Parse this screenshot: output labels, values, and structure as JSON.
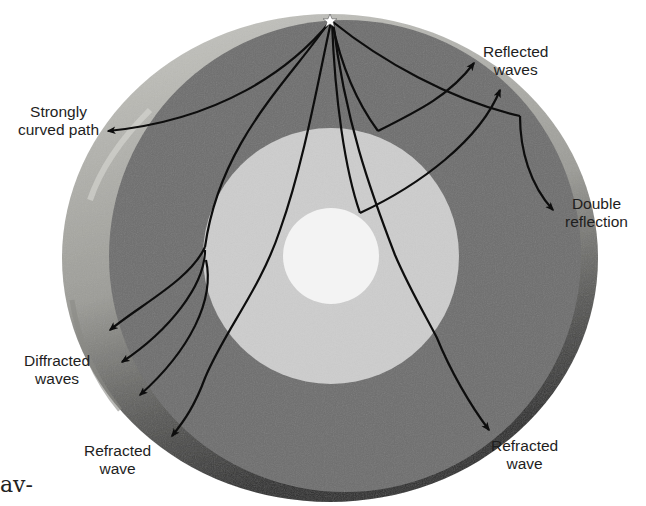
{
  "figure": {
    "colors": {
      "background": "#ffffff",
      "mantle": "#6e6e6e",
      "outer_core": "#cdcdcd",
      "inner_core": "#f4f4f4",
      "crust_light": "#b9b9b6",
      "crust_dark": "#3c3c3c",
      "ray": "#0d0d0d",
      "focus_star": "#ffffff"
    },
    "focus": {
      "symbol": "★",
      "name": "earthquake-focus"
    },
    "labels": {
      "strongly_curved": [
        "Strongly",
        "curved path"
      ],
      "reflected": [
        "Reflected",
        "waves"
      ],
      "double_reflection": [
        "Double",
        "reflection"
      ],
      "diffracted": [
        "Diffracted",
        "waves"
      ],
      "refracted_left": [
        "Refracted",
        "wave"
      ],
      "refracted_right": [
        "Refracted",
        "wave"
      ]
    },
    "cut_text_fragment": "av-"
  }
}
